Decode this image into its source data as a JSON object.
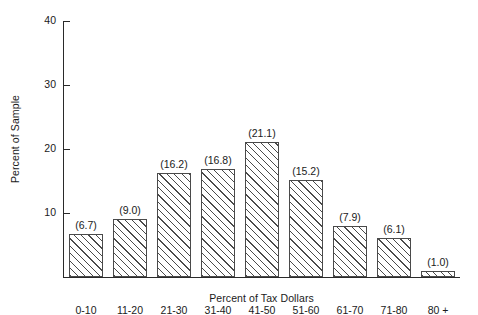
{
  "chart_data": {
    "type": "bar",
    "title": "",
    "subtitle": "",
    "xlabel": "Percent of Tax Dollars",
    "ylabel": "Percent of Sample",
    "categories": [
      "0-10",
      "11-20",
      "21-30",
      "31-40",
      "41-50",
      "51-60",
      "61-70",
      "71-80",
      "80 +"
    ],
    "values": [
      6.7,
      9.0,
      16.2,
      16.8,
      21.1,
      15.2,
      7.9,
      6.1,
      1.0
    ],
    "value_labels": [
      "(6.7)",
      "(9.0)",
      "(16.2)",
      "(16.8)",
      "(21.1)",
      "(15.2)",
      "(7.9)",
      "(6.1)",
      "(1.0)"
    ],
    "ylim": [
      0,
      40
    ],
    "xlim_note": "categorical",
    "yticks": [
      10,
      20,
      30,
      40
    ],
    "ytick_labels": [
      "10",
      "20",
      "30",
      "40"
    ],
    "grid": false,
    "legend": "none",
    "bar_fill": "diagonal-hatch",
    "colors": {
      "background": "#ffffff",
      "axis": "#2a2a2a",
      "bar_edge": "#4a4a4a",
      "bar_hatch": "#4a4a4a",
      "text": "#1a1a1a"
    }
  }
}
